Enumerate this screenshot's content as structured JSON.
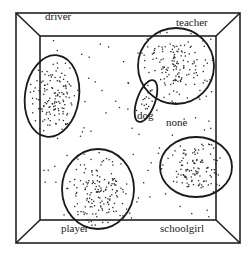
{
  "figure": {
    "type": "scatter-cluster-diagram",
    "frame": {
      "outer": {
        "x1": 16,
        "y1": 13,
        "x2": 240,
        "y2": 243
      },
      "inner": {
        "x1": 40,
        "y1": 36,
        "x2": 216,
        "y2": 220
      },
      "stroke": "#222222"
    },
    "clusters": [
      {
        "label": "driver",
        "cx": 52,
        "cy": 96,
        "rx": 27,
        "ry": 41,
        "rot": 8,
        "label_x": 45,
        "label_y": 41,
        "n": 130
      },
      {
        "label": "teacher",
        "cx": 176,
        "cy": 66,
        "rx": 38,
        "ry": 38,
        "rot": 0,
        "label_x": 178,
        "label_y": 18,
        "n": 120
      },
      {
        "label": "dog",
        "cx": 146,
        "cy": 101,
        "rx": 9,
        "ry": 22,
        "rot": 20,
        "label_x": 135,
        "label_y": 110,
        "n": 15
      },
      {
        "label": "player",
        "cx": 98,
        "cy": 189,
        "rx": 36,
        "ry": 40,
        "rot": 0,
        "label_x": 62,
        "label_y": 226,
        "n": 140
      },
      {
        "label": "schoolgirl",
        "cx": 196,
        "cy": 167,
        "rx": 36,
        "ry": 30,
        "rot": 0,
        "label_x": 161,
        "label_y": 225,
        "n": 110
      }
    ],
    "unclustered": {
      "label": "none",
      "label_x": 166,
      "label_y": 116,
      "n": 120
    },
    "point_color": "#2a2a2a"
  }
}
